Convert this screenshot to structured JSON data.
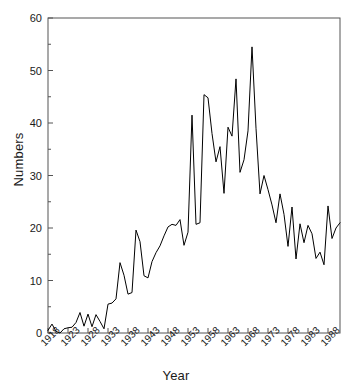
{
  "chart_data": {
    "type": "line",
    "title": "",
    "xlabel": "Year",
    "ylabel": "Numbers",
    "xlim": [
      1918,
      1991
    ],
    "ylim": [
      0,
      60
    ],
    "grid": false,
    "legend": null,
    "y_ticks_major": [
      0,
      10,
      20,
      30,
      40,
      50,
      60
    ],
    "y_ticks_minor": [
      5,
      15,
      25,
      35,
      45,
      55
    ],
    "x_ticks": [
      1918,
      1923,
      1928,
      1933,
      1938,
      1943,
      1948,
      1953,
      1958,
      1963,
      1968,
      1973,
      1978,
      1983,
      1988
    ],
    "line_color": "#000000",
    "series": [
      {
        "name": "Numbers",
        "x": [
          1918,
          1919,
          1920,
          1921,
          1922,
          1923,
          1924,
          1925,
          1926,
          1927,
          1928,
          1929,
          1930,
          1931,
          1932,
          1933,
          1934,
          1935,
          1936,
          1937,
          1938,
          1939,
          1940,
          1941,
          1942,
          1943,
          1944,
          1945,
          1946,
          1947,
          1948,
          1949,
          1950,
          1951,
          1952,
          1953,
          1954,
          1955,
          1956,
          1957,
          1958,
          1959,
          1960,
          1961,
          1962,
          1963,
          1964,
          1965,
          1966,
          1967,
          1968,
          1969,
          1970,
          1971,
          1972,
          1973,
          1974,
          1975,
          1976,
          1977,
          1978,
          1979,
          1980,
          1981,
          1982,
          1983,
          1984,
          1985,
          1986,
          1987,
          1988,
          1989,
          1990,
          1991
        ],
        "values": [
          0.5,
          1.7,
          0.3,
          0.0,
          0.8,
          1.0,
          1.1,
          2.0,
          3.9,
          1.3,
          3.6,
          1.2,
          3.5,
          2.2,
          0.8,
          5.5,
          5.7,
          6.5,
          13.4,
          11.0,
          7.4,
          7.7,
          19.6,
          17.4,
          10.9,
          10.5,
          13.6,
          15.3,
          16.6,
          18.5,
          20.2,
          20.7,
          20.5,
          21.6,
          16.7,
          19.2,
          41.5,
          20.7,
          21.0,
          45.4,
          44.8,
          38.0,
          32.6,
          35.5,
          26.6,
          39.2,
          37.5,
          48.4,
          30.6,
          33.0,
          38.5,
          54.5,
          39.0,
          26.5,
          30.0,
          27.3,
          24.4,
          21.0,
          26.5,
          22.6,
          16.5,
          24.0,
          14.1,
          20.8,
          17.2,
          20.5,
          18.9,
          14.2,
          15.4,
          13.0,
          24.2,
          18.0,
          20.0,
          21.0
        ]
      }
    ]
  },
  "axes": {
    "y_title": "Numbers",
    "x_title": "Year",
    "y_tick_labels": [
      "0",
      "10",
      "20",
      "30",
      "40",
      "50",
      "60"
    ],
    "x_tick_labels": [
      "1918",
      "1923",
      "1928",
      "1933",
      "1938",
      "1943",
      "1948",
      "1953",
      "1958",
      "1963",
      "1968",
      "1973",
      "1978",
      "1983",
      "1988"
    ]
  }
}
